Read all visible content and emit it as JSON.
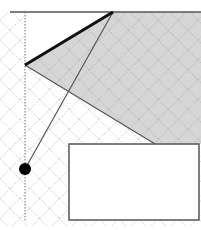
{
  "diagram": {
    "width": 201,
    "height": 230,
    "colors": {
      "background": "#ffffff",
      "shaded_region": "#d6d6d6",
      "grid": "#9a9a9a",
      "lines": "#555555",
      "thick_edge": "#111111",
      "point": "#000000",
      "box_border": "#555555",
      "box_fill": "#ffffff"
    },
    "top_line": {
      "x1": 10,
      "y1": 12,
      "x2": 201,
      "y2": 12
    },
    "vertical_guide": {
      "x1": 25,
      "y1": 12,
      "x2": 25,
      "y2": 222
    },
    "shaded_polygon": "25,65 113,12 201,12 201,144 155,144",
    "thick_edge": {
      "x1": 25,
      "y1": 65,
      "x2": 113,
      "y2": 12
    },
    "lower_edge": {
      "x1": 25,
      "y1": 65,
      "x2": 155,
      "y2": 144
    },
    "thin_line": {
      "x1": 113,
      "y1": 12,
      "x2": 25,
      "y2": 169
    },
    "point": {
      "cx": 25,
      "cy": 169,
      "r": 6
    },
    "box": {
      "x": 69,
      "y": 144,
      "width": 130,
      "height": 76
    }
  }
}
